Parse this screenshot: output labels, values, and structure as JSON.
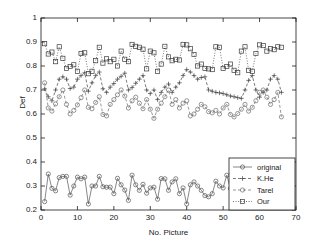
{
  "chart_data": {
    "type": "line",
    "title": "",
    "xlabel": "No. Picture",
    "ylabel": "Def",
    "xlim": [
      0,
      70
    ],
    "ylim": [
      0.2,
      1
    ],
    "xticks": [
      0,
      10,
      20,
      30,
      40,
      50,
      60,
      70
    ],
    "yticks": [
      0.2,
      0.3,
      0.4,
      0.5,
      0.6,
      0.7,
      0.8,
      0.9,
      1
    ],
    "grid": false,
    "legend_position": "lower right",
    "x": [
      1,
      2,
      3,
      4,
      5,
      6,
      7,
      8,
      9,
      10,
      11,
      12,
      13,
      14,
      15,
      16,
      17,
      18,
      19,
      20,
      21,
      22,
      23,
      24,
      25,
      26,
      27,
      28,
      29,
      30,
      31,
      32,
      33,
      34,
      35,
      36,
      37,
      38,
      39,
      40,
      41,
      42,
      43,
      44,
      45,
      46,
      47,
      48,
      49,
      50,
      51,
      52,
      53,
      54,
      55,
      56,
      57,
      58,
      59,
      60,
      61,
      62,
      63,
      64,
      65,
      66
    ],
    "series": [
      {
        "name": "original",
        "marker": "circle",
        "linestyle": "solid",
        "color": "#555555",
        "values": [
          0.235,
          0.35,
          0.29,
          0.28,
          0.335,
          0.34,
          0.34,
          0.262,
          0.3,
          0.337,
          0.33,
          0.337,
          0.225,
          0.3,
          0.3,
          0.34,
          0.297,
          0.295,
          0.295,
          0.268,
          0.332,
          0.305,
          0.283,
          0.24,
          0.345,
          0.305,
          0.282,
          0.307,
          0.27,
          0.292,
          0.295,
          0.245,
          0.331,
          0.33,
          0.282,
          0.317,
          0.33,
          0.268,
          0.292,
          0.225,
          0.305,
          0.317,
          0.3,
          0.282,
          0.26,
          0.255,
          0.268,
          0.32,
          0.3,
          0.292,
          0.345,
          0.29,
          0.26,
          0.3,
          0.29,
          0.292,
          0.29,
          0.287,
          0.285,
          0.288,
          0.29,
          0.29,
          0.29,
          0.29,
          0.29,
          0.29
        ]
      },
      {
        "name": "K.He",
        "marker": "plus",
        "linestyle": "dashed",
        "color": "#444444",
        "values": [
          0.705,
          0.672,
          0.655,
          0.7,
          0.745,
          0.755,
          0.745,
          0.706,
          0.712,
          0.745,
          0.76,
          0.772,
          0.695,
          0.73,
          0.76,
          0.775,
          0.705,
          0.69,
          0.712,
          0.727,
          0.745,
          0.757,
          0.77,
          0.7,
          0.71,
          0.728,
          0.745,
          0.76,
          0.7,
          0.685,
          0.7,
          0.66,
          0.69,
          0.712,
          0.725,
          0.69,
          0.712,
          0.73,
          0.76,
          0.785,
          0.775,
          0.76,
          0.745,
          0.752,
          0.755,
          0.7,
          0.695,
          0.69,
          0.688,
          0.685,
          0.68,
          0.675,
          0.672,
          0.668,
          0.665,
          0.7,
          0.74,
          0.76,
          0.7,
          0.67,
          0.69,
          0.7,
          0.745,
          0.76,
          0.745,
          0.69
        ]
      },
      {
        "name": "Tarel",
        "marker": "circle",
        "linestyle": "dashed",
        "color": "#6b6b6b",
        "values": [
          0.73,
          0.625,
          0.612,
          0.642,
          0.672,
          0.7,
          0.64,
          0.6,
          0.615,
          0.638,
          0.668,
          0.7,
          0.628,
          0.622,
          0.648,
          0.672,
          0.598,
          0.592,
          0.64,
          0.66,
          0.68,
          0.7,
          0.675,
          0.625,
          0.655,
          0.67,
          0.645,
          0.622,
          0.66,
          0.62,
          0.582,
          0.62,
          0.645,
          0.672,
          0.7,
          0.64,
          0.66,
          0.625,
          0.645,
          0.655,
          0.592,
          0.6,
          0.62,
          0.64,
          0.63,
          0.61,
          0.605,
          0.615,
          0.6,
          0.625,
          0.64,
          0.598,
          0.588,
          0.602,
          0.62,
          0.64,
          0.612,
          0.628,
          0.655,
          0.69,
          0.7,
          0.67,
          0.64,
          0.66,
          0.69,
          0.588
        ]
      },
      {
        "name": "Our",
        "marker": "square",
        "linestyle": "dotted",
        "color": "#3a3a3a",
        "values": [
          0.893,
          0.85,
          0.858,
          0.818,
          0.88,
          0.832,
          0.79,
          0.798,
          0.805,
          0.778,
          0.852,
          0.855,
          0.768,
          0.778,
          0.822,
          0.878,
          0.812,
          0.83,
          0.818,
          0.828,
          0.8,
          0.862,
          0.828,
          0.818,
          0.89,
          0.882,
          0.878,
          0.87,
          0.788,
          0.862,
          0.855,
          0.778,
          0.808,
          0.882,
          0.838,
          0.822,
          0.828,
          0.825,
          0.89,
          0.888,
          0.872,
          0.848,
          0.8,
          0.808,
          0.79,
          0.788,
          0.785,
          0.88,
          0.878,
          0.79,
          0.798,
          0.808,
          0.782,
          0.772,
          0.862,
          0.88,
          0.782,
          0.778,
          0.852,
          0.888,
          0.885,
          0.862,
          0.872,
          0.868,
          0.88,
          0.878
        ]
      }
    ]
  },
  "axes": {
    "ylabel": "Def",
    "xlabel": "No. Picture",
    "ytick_labels": [
      "1",
      "0.9",
      "0.8",
      "0.7",
      "0.6",
      "0.5",
      "0.4",
      "0.3",
      "0.2"
    ],
    "xtick_labels": [
      "0",
      "10",
      "20",
      "30",
      "40",
      "50",
      "60",
      "70"
    ]
  },
  "legend": {
    "items": [
      {
        "label": "original",
        "marker": "circle",
        "linestyle": "solid"
      },
      {
        "label": "K.He",
        "marker": "plus",
        "linestyle": "dashed"
      },
      {
        "label": "Tarel",
        "marker": "circle",
        "linestyle": "dashed"
      },
      {
        "label": "Our",
        "marker": "square",
        "linestyle": "dotted"
      }
    ]
  }
}
